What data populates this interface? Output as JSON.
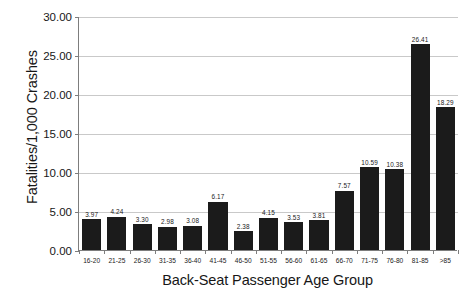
{
  "chart_data": {
    "type": "bar",
    "title": "",
    "xlabel": "Back-Seat Passenger Age Group",
    "ylabel": "Fatalities/1,000 Crashes",
    "categories": [
      "16-20",
      "21-25",
      "26-30",
      "31-35",
      "36-40",
      "41-45",
      "46-50",
      "51-55",
      "56-60",
      "61-65",
      "66-70",
      "71-75",
      "76-80",
      "81-85",
      ">85"
    ],
    "values": [
      3.97,
      4.24,
      3.3,
      2.98,
      3.08,
      6.17,
      2.38,
      4.15,
      3.53,
      3.81,
      7.57,
      10.59,
      10.38,
      26.41,
      18.29
    ],
    "value_labels": [
      "3.97",
      "4.24",
      "3.30",
      "2.98",
      "3.08",
      "6.17",
      "2.38",
      "4.15",
      "3.53",
      "3.81",
      "7.57",
      "10.59",
      "10.38",
      "26.41",
      "18.29"
    ],
    "ylim": [
      0,
      30
    ],
    "ytick_values": [
      0,
      5,
      10,
      15,
      20,
      25,
      30
    ],
    "ytick_labels": [
      "0.00",
      "5.00",
      "10.00",
      "15.00",
      "20.00",
      "25.00",
      "30.00"
    ],
    "grid": true,
    "legend": false,
    "bar_color": "#1b1b1b",
    "axis_color": "#7d7d7d",
    "grid_color": "#c9c9c9",
    "background_color": "#ffffff"
  }
}
